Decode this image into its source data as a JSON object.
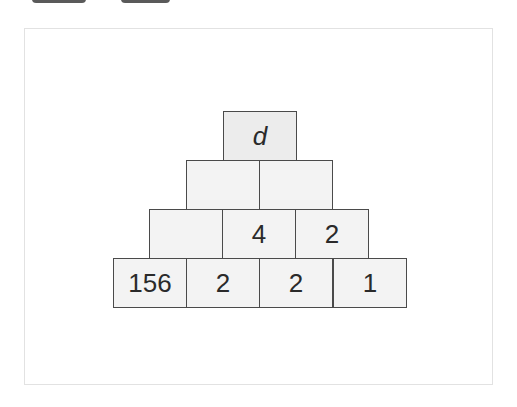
{
  "toolbar": {
    "buttons": [
      {
        "label": ""
      },
      {
        "label": ""
      }
    ]
  },
  "pyramid": {
    "rows": [
      [
        "d"
      ],
      [
        "",
        ""
      ],
      [
        "",
        "4",
        "2"
      ],
      [
        "156",
        "2",
        "2",
        "1"
      ]
    ]
  }
}
